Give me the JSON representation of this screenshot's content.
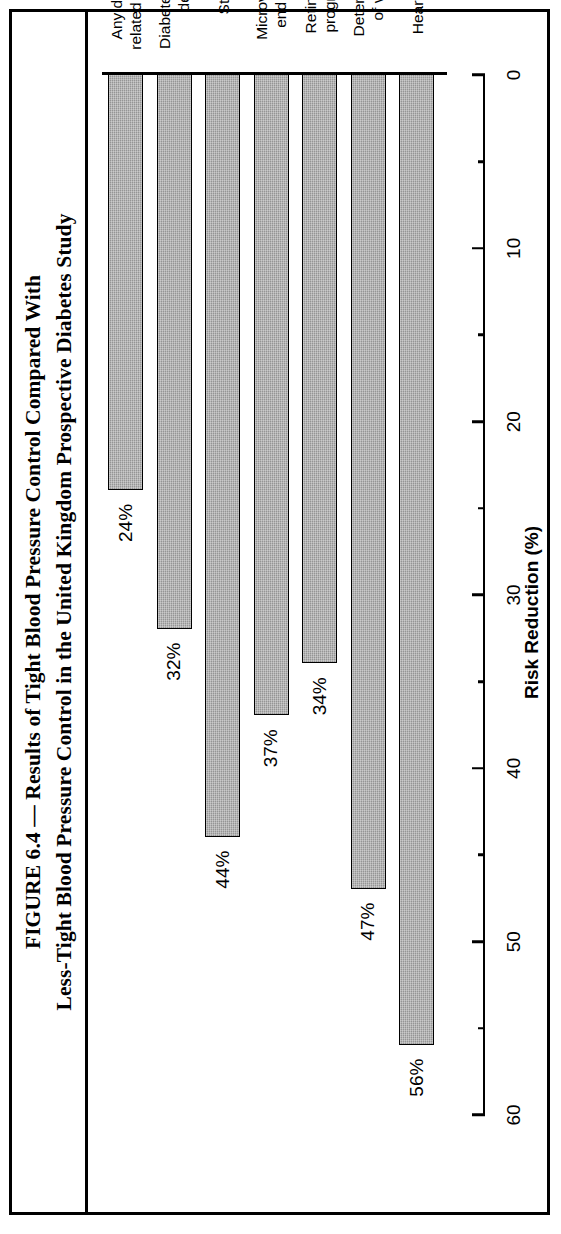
{
  "figure": {
    "caption_lines": [
      "FIGURE 6.4 — Results of Tight Blood Pressure Control Compared With",
      "Less-Tight Blood Pressure Control in the United Kingdom Prospective Diabetes Study"
    ]
  },
  "chart_data": {
    "type": "bar",
    "orientation": "horizontal",
    "title": "FIGURE 6.4 — Results of Tight Blood Pressure Control Compared With Less-Tight Blood Pressure Control in the United Kingdom Prospective Diabetes Study",
    "xlabel": "",
    "ylabel": "Risk Reduction (%)",
    "value_axis_label": "Risk Reduction (%)",
    "ylim": [
      0,
      60
    ],
    "grid": false,
    "legend": false,
    "tick_labels": [
      "0",
      "10",
      "20",
      "30",
      "40",
      "50",
      "60"
    ],
    "tick_values": [
      0,
      10,
      20,
      30,
      40,
      50,
      60
    ],
    "minor_tick_interval": 5,
    "categories": [
      "Any diabetes-\nrelated end point",
      "Diabetes-related\ndeath",
      "Stroke",
      "Microvascular\nend points",
      "Retinopathy\nprogression",
      "Deterioration\nof vision",
      "Heart failure"
    ],
    "values": [
      24,
      32,
      44,
      37,
      34,
      47,
      56
    ],
    "data_labels": [
      "24%",
      "32%",
      "44%",
      "37%",
      "34%",
      "47%",
      "56%"
    ],
    "bar_fill_color": "#a6a6a6",
    "bar_edge_color": "#000000"
  }
}
